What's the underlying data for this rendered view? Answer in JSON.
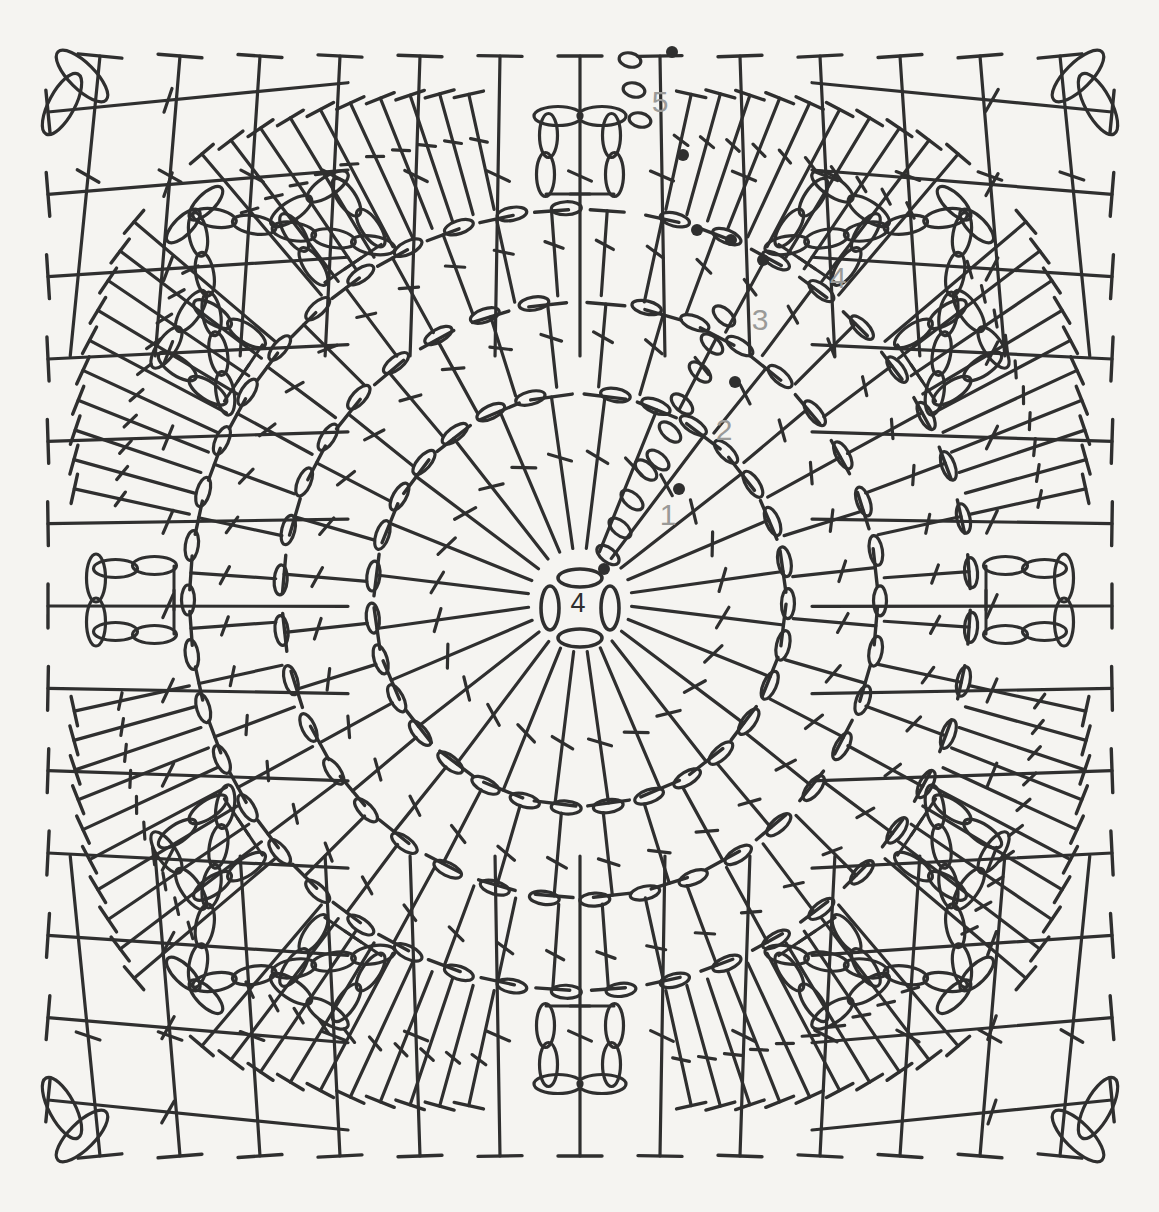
{
  "document": {
    "type": "crochet-stitch-chart",
    "title": "Granny square crochet chart",
    "background_color": "#f5f4f1",
    "ink_color": "#2f2f2f",
    "label_color": "#9a9a98",
    "width": 1159,
    "height": 1212
  },
  "round_labels": [
    {
      "id": "center",
      "text": "4",
      "x": 578,
      "y": 612,
      "color": "#2f2f2f",
      "note": "chain-4 ring at center"
    },
    {
      "id": "r1",
      "text": "1",
      "x": 668,
      "y": 525,
      "color": "#9a9a98"
    },
    {
      "id": "r2",
      "text": "2",
      "x": 724,
      "y": 440,
      "color": "#9a9a98"
    },
    {
      "id": "r3",
      "text": "3",
      "x": 760,
      "y": 330,
      "color": "#9a9a98"
    },
    {
      "id": "r4",
      "text": "4",
      "x": 838,
      "y": 288,
      "color": "#9a9a98"
    },
    {
      "id": "r5",
      "text": "5",
      "x": 660,
      "y": 112,
      "color": "#9a9a98"
    }
  ],
  "legend_symbols": [
    {
      "name": "chain-stitch",
      "glyph": "oval",
      "description": "chain (ch)"
    },
    {
      "name": "slip-stitch",
      "glyph": "filled-dot",
      "description": "slip stitch (sl st)"
    },
    {
      "name": "double-crochet",
      "glyph": "vertical-line-one-bar",
      "description": "double crochet (dc)"
    }
  ],
  "chart_data": {
    "type": "diagram",
    "rounds": [
      {
        "round": "center",
        "label": "4",
        "stitch": "chain-ring",
        "count": 4,
        "radius": 34
      },
      {
        "round": 1,
        "label": "1",
        "stitch": "double-crochet",
        "count": 24,
        "ring_radius": 210,
        "inner_radius": 46
      },
      {
        "round": 2,
        "label": "2",
        "stitch": "double-crochet",
        "count": 32,
        "ring_radius": 300,
        "inner_radius": 212
      },
      {
        "round": 3,
        "label": "3",
        "stitch": "double-crochet",
        "count": 44,
        "ring_radius": 392,
        "inner_radius": 302
      },
      {
        "round": 4,
        "label": "4",
        "stitch": "double-crochet-corner-fans",
        "corners": 4,
        "ring_radius": 470
      },
      {
        "round": 5,
        "label": "5",
        "stitch": "double-crochet",
        "edge_stitches_per_side": 13,
        "square_half": 545
      }
    ],
    "slip_stitch_markers": [
      {
        "round": "center",
        "x": 604,
        "y": 569
      },
      {
        "round": 1,
        "x": 679,
        "y": 489
      },
      {
        "round": 2,
        "x": 735,
        "y": 382
      },
      {
        "round": 3,
        "x": 763,
        "y": 260
      },
      {
        "round": 3,
        "x": 731,
        "y": 240
      },
      {
        "round": 3,
        "x": 697,
        "y": 230
      },
      {
        "round": 4,
        "x": 683,
        "y": 155
      },
      {
        "round": 5,
        "x": 672,
        "y": 52
      }
    ],
    "grid": false,
    "legend_position": "none"
  }
}
